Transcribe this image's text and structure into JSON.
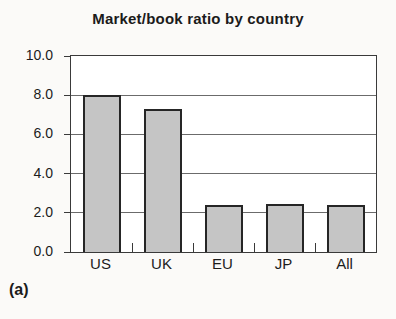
{
  "figure": {
    "panel_label": "(a)"
  },
  "chart_data": {
    "type": "bar",
    "title": "Market/book ratio by country",
    "categories": [
      "US",
      "UK",
      "EU",
      "JP",
      "All"
    ],
    "values": [
      8.0,
      7.3,
      2.4,
      2.45,
      2.4
    ],
    "xlabel": "",
    "ylabel": "",
    "ylim": [
      0,
      10
    ],
    "ytick_interval": 2,
    "ytick_labels": [
      "0.0",
      "2.0",
      "4.0",
      "6.0",
      "8.0",
      "10.0"
    ],
    "grid": true,
    "legend_position": "none",
    "colors": {
      "bar_fill": "#c5c5c5",
      "bar_border": "#262626",
      "gridline": "#6b6b6b",
      "frame": "#3a3a3a",
      "text": "#1c1c1c",
      "paper": "#fbfaf8"
    }
  }
}
